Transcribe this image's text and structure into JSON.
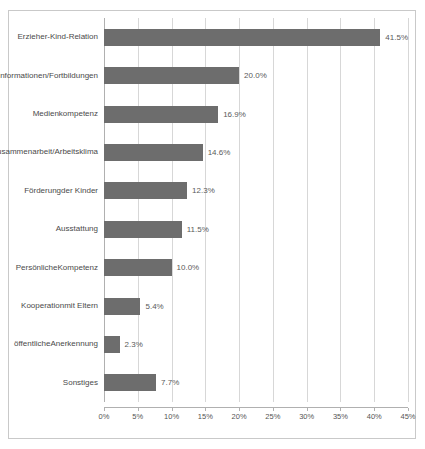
{
  "chart_data": {
    "type": "bar",
    "orientation": "horizontal",
    "title": "",
    "subtitle": "",
    "xlabel": "",
    "ylabel": "",
    "xlim": [
      0,
      45
    ],
    "grid": true,
    "legend": null,
    "bar_color": "#6d6d6d",
    "frame_color": "#c9c9c9",
    "gridline_color": "#d7d7d7",
    "value_suffix": "%",
    "xticks": [
      0,
      5,
      10,
      15,
      20,
      25,
      30,
      35,
      40,
      45
    ],
    "xticklabels": [
      "0%",
      "5%",
      "10%",
      "15%",
      "20%",
      "25%",
      "30%",
      "35%",
      "40%",
      "45%"
    ],
    "categories": [
      "Erzieher-Kind-Relation",
      "Informationen/Fortbildungen",
      "Medienkompetenz",
      "Zusammenarbeit/Arbeitsklima",
      "Förderung der Kinder",
      "Ausstattung",
      "Persönliche Kompetenz",
      "Kooperation mit Eltern",
      "öffentliche Anerkennung",
      "Sonstiges"
    ],
    "values": [
      41.5,
      20.0,
      16.9,
      14.6,
      12.3,
      11.5,
      10.0,
      5.4,
      2.3,
      7.7
    ],
    "data_labels": [
      "41.5%",
      "20.0%",
      "16.9%",
      "14.6%",
      "12.3%",
      "11.5%",
      "10.0%",
      "5.4%",
      "2.3%",
      "7.7%"
    ],
    "rows": [
      {
        "category_lines": [
          "Erzieher-Kind-",
          "Relation"
        ],
        "value": 41.5,
        "label": "41.5%"
      },
      {
        "category_lines": [
          "Informationen/",
          "Fortbildungen"
        ],
        "value": 20.0,
        "label": "20.0%"
      },
      {
        "category_lines": [
          "Medienkompetenz"
        ],
        "value": 16.9,
        "label": "16.9%"
      },
      {
        "category_lines": [
          "Zusammenarbeit/",
          "Arbeitsklima"
        ],
        "value": 14.6,
        "label": "14.6%"
      },
      {
        "category_lines": [
          "Förderung",
          "der Kinder"
        ],
        "value": 12.3,
        "label": "12.3%"
      },
      {
        "category_lines": [
          "Ausstattung"
        ],
        "value": 11.5,
        "label": "11.5%"
      },
      {
        "category_lines": [
          "Persönliche",
          "Kompetenz"
        ],
        "value": 10.0,
        "label": "10.0%"
      },
      {
        "category_lines": [
          "Kooperation",
          "mit Eltern"
        ],
        "value": 5.4,
        "label": "5.4%"
      },
      {
        "category_lines": [
          "öffentliche",
          "Anerkennung"
        ],
        "value": 2.3,
        "label": "2.3%"
      },
      {
        "category_lines": [
          "Sonstiges"
        ],
        "value": 7.7,
        "label": "7.7%"
      }
    ]
  }
}
